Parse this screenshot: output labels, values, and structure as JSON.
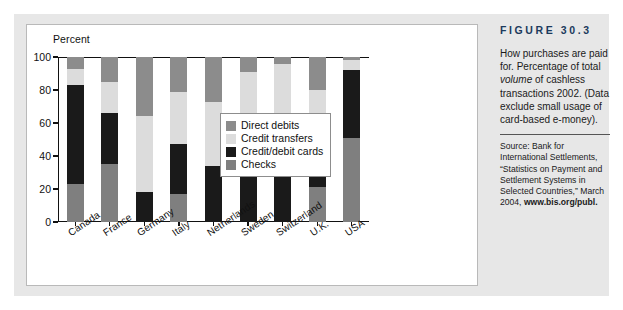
{
  "figure": {
    "number_label": "FIGURE 30.3",
    "caption_line1": "How purchases are paid",
    "caption_line2": "for. Percentage of total",
    "caption_italic": "volume",
    "caption_line3_rest": " of cashless",
    "caption_line4": "transactions 2002. (Data",
    "caption_line5": "exclude small usage of",
    "caption_line6": "card-based e-money).",
    "source_prefix": "Source: Bank for International Settlements, “Statistics on Payment and Settlement Systems in Selected Countries,” March 2004, ",
    "source_url": "www.bis.org/publ."
  },
  "chart_data": {
    "type": "bar",
    "subtype": "stacked-vertical",
    "title": "",
    "xlabel": "",
    "ylabel": "Percent",
    "ylim": [
      0,
      100
    ],
    "yticks": [
      0,
      20,
      40,
      60,
      80,
      100
    ],
    "ytick_labels": [
      "0",
      "20",
      "40",
      "60",
      "80",
      "100"
    ],
    "grid": false,
    "legend_position": "inside-right",
    "stack_order_bottom_to_top": [
      "Checks",
      "Credit/debit cards",
      "Credit transfers",
      "Direct debits"
    ],
    "categories": [
      "Canada",
      "France",
      "Germany",
      "Italy",
      "Netherlands",
      "Sweden",
      "Switzerland",
      "U.K.",
      "USA"
    ],
    "series": [
      {
        "name": "Checks",
        "color": "#7f7f7f",
        "values": [
          23,
          35,
          0,
          17,
          0,
          0,
          0,
          21,
          51
        ]
      },
      {
        "name": "Credit/debit cards",
        "color": "#1a1a1a",
        "values": [
          60,
          31,
          18,
          30,
          34,
          52,
          36,
          42,
          41
        ]
      },
      {
        "name": "Credit transfers",
        "color": "#dcdcdc",
        "values": [
          10,
          19,
          46,
          32,
          39,
          39,
          60,
          17,
          6
        ]
      },
      {
        "name": "Direct debits",
        "color": "#8c8c8c",
        "values": [
          7,
          15,
          36,
          21,
          27,
          9,
          4,
          20,
          2
        ]
      }
    ]
  },
  "legend": {
    "items": [
      {
        "label": "Direct debits",
        "color": "#8c8c8c"
      },
      {
        "label": "Credit transfers",
        "color": "#dcdcdc"
      },
      {
        "label": "Credit/debit cards",
        "color": "#1a1a1a"
      },
      {
        "label": "Checks",
        "color": "#7f7f7f"
      }
    ]
  },
  "colors": {
    "plate": "#e7e7e7",
    "panel": "#ffffff",
    "panel_border": "#b9b9b9",
    "axis": "#111111",
    "figure_number": "#1b3a5c"
  }
}
